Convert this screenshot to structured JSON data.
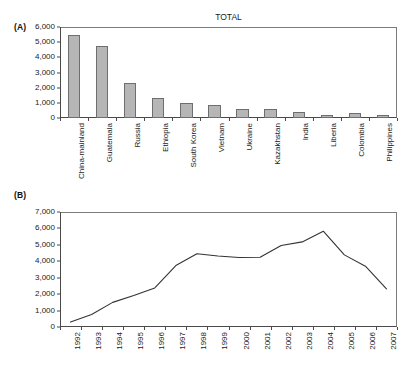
{
  "figure": {
    "panel_a_label": "(A)",
    "panel_b_label": "(B)"
  },
  "chart_data": [
    {
      "panel": "(A)",
      "type": "bar",
      "title": "TOTAL",
      "xlabel": "",
      "ylabel": "",
      "ylim": [
        0,
        6000
      ],
      "yticks": [
        0,
        1000,
        2000,
        3000,
        4000,
        5000,
        6000
      ],
      "ytick_labels": [
        "0",
        "1,000",
        "2,000",
        "3,000",
        "4,000",
        "5,000",
        "6,000"
      ],
      "grid": false,
      "legend": "none",
      "bar_color": "#b6b6b6",
      "bar_edge_color": "#6e6e6e",
      "categories": [
        "China-mainland",
        "Guatemala",
        "Russia",
        "Ethiopia",
        "South Korea",
        "Vietnam",
        "Ukraine",
        "Kazakhstan",
        "India",
        "Liberia",
        "Colombia",
        "Philippines"
      ],
      "values": [
        5500,
        4750,
        2330,
        1290,
        960,
        850,
        620,
        600,
        380,
        230,
        310,
        225
      ]
    },
    {
      "panel": "(B)",
      "type": "line",
      "title": "",
      "xlabel": "",
      "ylabel": "",
      "ylim": [
        0,
        7000
      ],
      "yticks": [
        0,
        1000,
        2000,
        3000,
        4000,
        5000,
        6000,
        7000
      ],
      "ytick_labels": [
        "0",
        "1,000",
        "2,000",
        "3,000",
        "4,000",
        "5,000",
        "6,000",
        "7,000"
      ],
      "grid": false,
      "legend": "none",
      "line_color": "#333333",
      "x": [
        "1992",
        "1993",
        "1994",
        "1995",
        "1996",
        "1997",
        "1998",
        "1999",
        "2000",
        "2001",
        "2002",
        "2003",
        "2004",
        "2005",
        "2006",
        "2007"
      ],
      "values": [
        300,
        760,
        1500,
        1920,
        2380,
        3740,
        4460,
        4320,
        4230,
        4250,
        4960,
        5180,
        5830,
        4390,
        3700,
        2320
      ]
    }
  ]
}
